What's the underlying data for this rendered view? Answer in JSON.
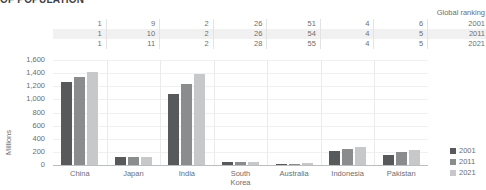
{
  "title": "OF POPULATION",
  "ranking": {
    "header_label": "Global ranking",
    "years": [
      "2001",
      "2011",
      "2021"
    ],
    "rows": [
      {
        "year": "2001",
        "values": [
          "1",
          "9",
          "2",
          "26",
          "51",
          "4",
          "6"
        ]
      },
      {
        "year": "2011",
        "values": [
          "1",
          "10",
          "2",
          "26",
          "54",
          "4",
          "5"
        ]
      },
      {
        "year": "2021",
        "values": [
          "1",
          "11",
          "2",
          "28",
          "55",
          "4",
          "5"
        ]
      }
    ]
  },
  "legend": {
    "items": [
      {
        "label": "2001",
        "color": "#58595b"
      },
      {
        "label": "2011",
        "color": "#8b8c8e"
      },
      {
        "label": "2021",
        "color": "#c7c8ca"
      }
    ]
  },
  "chart_data": {
    "type": "bar",
    "title": "OF POPULATION",
    "xlabel": "",
    "ylabel": "Millions",
    "ylim": [
      0,
      1600
    ],
    "ytick_labels": [
      "1,600",
      "1,400",
      "1,200",
      "1,000",
      "800",
      "600",
      "400",
      "200",
      "0"
    ],
    "ytick_values": [
      1600,
      1400,
      1200,
      1000,
      800,
      600,
      400,
      200,
      0
    ],
    "grid": true,
    "legend_position": "right",
    "categories": [
      "China",
      "Japan",
      "India",
      "South Korea",
      "Australia",
      "Indonesia",
      "Pakistan"
    ],
    "category_labels": [
      "China",
      "Japan",
      "India",
      "South\nKorea",
      "Australia",
      "Indonesia",
      "Pakistan"
    ],
    "series": [
      {
        "name": "2001",
        "color": "#58595b",
        "values": [
          1272,
          127,
          1080,
          47,
          19,
          215,
          145
        ]
      },
      {
        "name": "2011",
        "color": "#8b8c8e",
        "values": [
          1345,
          128,
          1240,
          50,
          22,
          245,
          195
        ]
      },
      {
        "name": "2021",
        "color": "#c7c8ca",
        "values": [
          1412,
          125,
          1390,
          52,
          26,
          274,
          231
        ]
      }
    ],
    "annotations": {
      "global_ranking": {
        "label": "Global ranking",
        "2001": [
          1,
          9,
          2,
          26,
          51,
          4,
          6
        ],
        "2011": [
          1,
          10,
          2,
          26,
          54,
          4,
          5
        ],
        "2021": [
          1,
          11,
          2,
          28,
          55,
          4,
          5
        ]
      }
    }
  }
}
